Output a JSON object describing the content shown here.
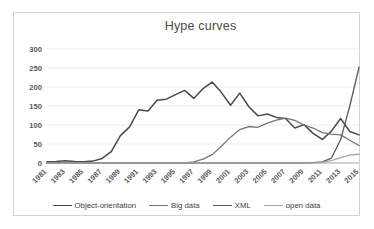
{
  "chart_data": {
    "type": "line",
    "title": "Hype curves",
    "xlabel": "",
    "ylabel": "",
    "ylim": [
      0,
      300
    ],
    "yticks": [
      0,
      50,
      100,
      150,
      200,
      250,
      300
    ],
    "grid": true,
    "legend_position": "bottom",
    "x": [
      1981,
      1982,
      1983,
      1984,
      1985,
      1986,
      1987,
      1988,
      1989,
      1990,
      1991,
      1992,
      1993,
      1994,
      1995,
      1996,
      1997,
      1998,
      1999,
      2000,
      2001,
      2002,
      2003,
      2004,
      2005,
      2006,
      2007,
      2008,
      2009,
      2010,
      2011,
      2012,
      2013,
      2014,
      2015
    ],
    "xtick_labels": [
      "1981",
      "1983",
      "1985",
      "1987",
      "1989",
      "1991",
      "1993",
      "1995",
      "1997",
      "1999",
      "2001",
      "2003",
      "2005",
      "2007",
      "2009",
      "2011",
      "2013",
      "2015"
    ],
    "series": [
      {
        "name": "Object-orientation",
        "color": "#4a4a4a",
        "width": 1.5,
        "values": [
          3,
          4,
          6,
          4,
          3,
          5,
          12,
          30,
          72,
          95,
          140,
          137,
          165,
          168,
          180,
          191,
          170,
          196,
          213,
          186,
          152,
          184,
          148,
          124,
          129,
          120,
          117,
          92,
          101,
          78,
          62,
          84,
          117,
          83,
          74
        ]
      },
      {
        "name": "Big data",
        "color": "#737373",
        "width": 1.3,
        "values": [
          0,
          0,
          0,
          0,
          0,
          0,
          0,
          0,
          0,
          0,
          0,
          0,
          0,
          0,
          0,
          0,
          3,
          10,
          22,
          44,
          68,
          88,
          96,
          94,
          105,
          113,
          118,
          112,
          100,
          92,
          80,
          76,
          74,
          60,
          46
        ]
      },
      {
        "name": "XML",
        "color": "#595959",
        "width": 1.3,
        "values": [
          0,
          0,
          0,
          0,
          0,
          0,
          0,
          0,
          0,
          0,
          0,
          0,
          0,
          0,
          0,
          0,
          0,
          0,
          0,
          0,
          0,
          0,
          0,
          0,
          0,
          0,
          0,
          0,
          0,
          1,
          3,
          13,
          62,
          150,
          252
        ]
      },
      {
        "name": "open data",
        "color": "#a6a6a6",
        "width": 1.3,
        "values": [
          0,
          0,
          0,
          0,
          0,
          0,
          0,
          0,
          0,
          0,
          0,
          0,
          0,
          0,
          0,
          0,
          0,
          0,
          0,
          0,
          0,
          0,
          0,
          0,
          0,
          0,
          0,
          0,
          0,
          0,
          2,
          6,
          14,
          21,
          23
        ]
      }
    ]
  }
}
